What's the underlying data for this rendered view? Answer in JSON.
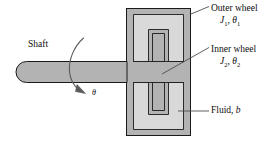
{
  "figure": {
    "type": "mechanical-schematic",
    "background_color": "#ffffff",
    "body_fill": "#b3b3b3",
    "fluid_fill": "#d9d9d9",
    "outline_color": "#1a1a1a",
    "leader_color": "#4d4d4d",
    "text_color": "#0d0d0d"
  },
  "labels": {
    "shaft": "Shaft",
    "theta": "θ",
    "outer_wheel": {
      "name": "Outer wheel",
      "inertia": "J",
      "inertia_sub": "1",
      "separator": ", ",
      "angle": "θ",
      "angle_sub": "1"
    },
    "inner_wheel": {
      "name": "Inner wheel",
      "inertia": "J",
      "inertia_sub": "2",
      "separator": ", ",
      "angle": "θ",
      "angle_sub": "2"
    },
    "fluid": {
      "name": "Fluid",
      "separator": ", ",
      "symbol": "b"
    }
  },
  "parts": {
    "shaft_name": "shaft",
    "outer_wheel_name": "outer-wheel-housing",
    "inner_wheel_name": "inner-wheel-rotor",
    "fluid_name": "fluid-gap",
    "rotation_arrow_name": "rotation-direction-arrow"
  }
}
